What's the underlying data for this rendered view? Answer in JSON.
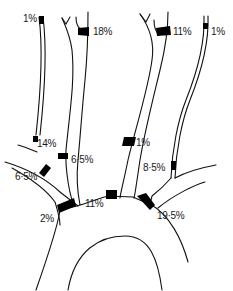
{
  "figure": {
    "caption_partial": "",
    "type": "arterial flow distribution diagram",
    "colors": {
      "line": "#111111",
      "band": "#000000",
      "background": "#ffffff"
    }
  },
  "labels": [
    {
      "id": "lbl-1",
      "text": "1%",
      "x": 23,
      "y": 14
    },
    {
      "id": "lbl-2",
      "text": "18%",
      "x": 93,
      "y": 27
    },
    {
      "id": "lbl-3",
      "text": "11%",
      "x": 173,
      "y": 27
    },
    {
      "id": "lbl-4",
      "text": "1%",
      "x": 208,
      "y": 27
    },
    {
      "id": "lbl-5",
      "text": "14%",
      "x": 37,
      "y": 139
    },
    {
      "id": "lbl-6",
      "text": "1%",
      "x": 136,
      "y": 139
    },
    {
      "id": "lbl-7",
      "text": "6·5%",
      "x": 71,
      "y": 155
    },
    {
      "id": "lbl-8",
      "text": "8·5%",
      "x": 143,
      "y": 163
    },
    {
      "id": "lbl-9",
      "text": "6·5%",
      "x": 15,
      "y": 171
    },
    {
      "id": "lbl-10",
      "text": "11%",
      "x": 85,
      "y": 200
    },
    {
      "id": "lbl-11",
      "text": "2%",
      "x": 40,
      "y": 214
    },
    {
      "id": "lbl-12",
      "text": "19·5%",
      "x": 157,
      "y": 211
    }
  ]
}
